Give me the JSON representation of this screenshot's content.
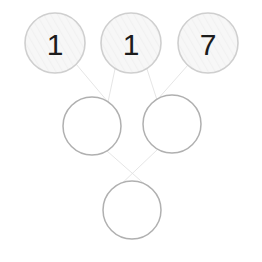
{
  "puzzle": {
    "title": "Number Pyramid",
    "type": "addition-pyramid",
    "background_color": "#ffffff",
    "filled_fill_color": "#f7f7f7",
    "filled_stroke_color": "#cfcfcf",
    "empty_fill_color": "#ffffff",
    "empty_stroke_color": "#b0b0b0",
    "edge_color": "#e2e2e2",
    "text_color": "#1c1c1c",
    "rows": [
      {
        "row_index": 0,
        "name": "top-row",
        "nodes": [
          {
            "id": "node-0-0",
            "value": "1",
            "filled": true,
            "cx": 55,
            "cy": 43,
            "r": 30
          },
          {
            "id": "node-0-1",
            "value": "1",
            "filled": true,
            "cx": 131,
            "cy": 43,
            "r": 30
          },
          {
            "id": "node-0-2",
            "value": "7",
            "filled": true,
            "cx": 208,
            "cy": 43,
            "r": 30
          }
        ]
      },
      {
        "row_index": 1,
        "name": "middle-row",
        "nodes": [
          {
            "id": "node-1-0",
            "value": "",
            "filled": false,
            "cx": 92,
            "cy": 126,
            "r": 29
          },
          {
            "id": "node-1-1",
            "value": "",
            "filled": false,
            "cx": 172,
            "cy": 124,
            "r": 29
          }
        ]
      },
      {
        "row_index": 2,
        "name": "bottom-row",
        "nodes": [
          {
            "id": "node-2-0",
            "value": "",
            "filled": false,
            "cx": 132,
            "cy": 210,
            "r": 29
          }
        ]
      }
    ],
    "edges": [
      {
        "id": "edge-0",
        "from": "node-0-0",
        "to": "node-1-0",
        "x1": 76,
        "y1": 64,
        "x2": 108,
        "y2": 102
      },
      {
        "id": "edge-1",
        "from": "node-0-1",
        "to": "node-1-0",
        "x1": 115,
        "y1": 69,
        "x2": 108,
        "y2": 102
      },
      {
        "id": "edge-2",
        "from": "node-0-1",
        "to": "node-1-1",
        "x1": 147,
        "y1": 69,
        "x2": 157,
        "y2": 100
      },
      {
        "id": "edge-3",
        "from": "node-0-2",
        "to": "node-1-1",
        "x1": 188,
        "y1": 65,
        "x2": 157,
        "y2": 100
      },
      {
        "id": "edge-4",
        "from": "node-1-0",
        "to": "node-2-0",
        "x1": 107,
        "y1": 151,
        "x2": 149,
        "y2": 188
      },
      {
        "id": "edge-5",
        "from": "node-1-1",
        "to": "node-2-0",
        "x1": 158,
        "y1": 149,
        "x2": 116,
        "y2": 189
      }
    ]
  }
}
